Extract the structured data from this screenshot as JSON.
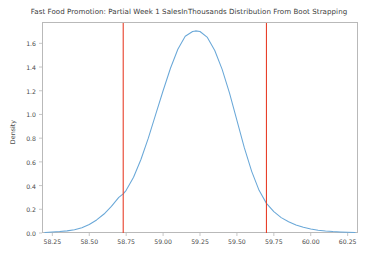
{
  "chart_data": {
    "type": "line",
    "title": "Fast Food Promotion: Partial Week 1 SalesInThousands Distribution From Boot Strapping",
    "xlabel": "",
    "ylabel": "Density",
    "xlim": [
      58.18,
      60.32
    ],
    "ylim": [
      0.0,
      1.78
    ],
    "grid": false,
    "legend": null,
    "xticks": [
      58.25,
      58.5,
      58.75,
      59.0,
      59.25,
      59.5,
      59.75,
      60.0,
      60.25
    ],
    "xtick_labels": [
      "58.25",
      "58.50",
      "58.75",
      "59.00",
      "59.25",
      "59.50",
      "59.75",
      "60.00",
      "60.25"
    ],
    "yticks": [
      0.0,
      0.2,
      0.4,
      0.6,
      0.8,
      1.0,
      1.2,
      1.4,
      1.6
    ],
    "ytick_labels": [
      "0.0",
      "0.2",
      "0.4",
      "0.6",
      "0.8",
      "1.0",
      "1.2",
      "1.4",
      "1.6"
    ],
    "series": [
      {
        "name": "Density",
        "color": "#6aa8d8",
        "x": [
          58.2,
          58.25,
          58.3,
          58.35,
          58.4,
          58.45,
          58.5,
          58.55,
          58.6,
          58.65,
          58.7,
          58.73,
          58.75,
          58.8,
          58.85,
          58.9,
          58.95,
          59.0,
          59.05,
          59.1,
          59.15,
          59.2,
          59.22,
          59.25,
          59.3,
          59.35,
          59.4,
          59.45,
          59.5,
          59.55,
          59.6,
          59.65,
          59.7,
          59.75,
          59.8,
          59.85,
          59.9,
          59.95,
          60.0,
          60.05,
          60.1,
          60.15,
          60.2,
          60.25,
          60.3
        ],
        "y": [
          0.005,
          0.008,
          0.012,
          0.018,
          0.028,
          0.045,
          0.072,
          0.11,
          0.16,
          0.225,
          0.3,
          0.33,
          0.36,
          0.47,
          0.62,
          0.8,
          1.0,
          1.2,
          1.39,
          1.55,
          1.66,
          1.7,
          1.705,
          1.7,
          1.65,
          1.54,
          1.38,
          1.18,
          0.95,
          0.72,
          0.52,
          0.36,
          0.25,
          0.18,
          0.13,
          0.095,
          0.068,
          0.048,
          0.034,
          0.024,
          0.017,
          0.012,
          0.009,
          0.006,
          0.004
        ]
      }
    ],
    "annotations": [
      {
        "name": "lower-confidence-bound",
        "type": "vline",
        "x": 58.73,
        "color": "#e8402a"
      },
      {
        "name": "upper-confidence-bound",
        "type": "vline",
        "x": 59.7,
        "color": "#e8402a"
      }
    ]
  }
}
